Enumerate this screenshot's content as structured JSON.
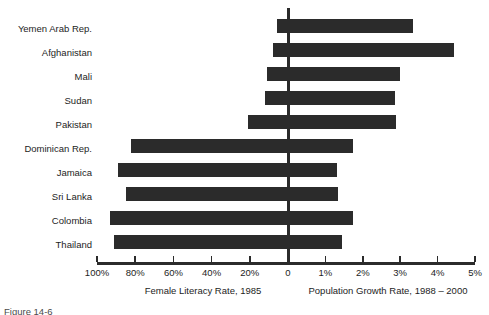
{
  "chart_data": {
    "type": "bar",
    "orientation": "horizontal",
    "subtype": "bidirectional-diverging",
    "title": "",
    "categories": [
      "Yemen Arab Rep.",
      "Afghanistan",
      "Mali",
      "Sudan",
      "Pakistan",
      "Dominican Rep.",
      "Jamaica",
      "Sri Lanka",
      "Colombia",
      "Thailand"
    ],
    "series": [
      {
        "name": "Female Literacy Rate, 1985",
        "axis": "left",
        "unit": "%",
        "direction": "leftward",
        "values": [
          6,
          8,
          11,
          12,
          21,
          82,
          89,
          85,
          93,
          91
        ]
      },
      {
        "name": "Population Growth  Rate, 1988 – 2000",
        "axis": "right",
        "unit": "%",
        "direction": "rightward",
        "values": [
          3.35,
          4.45,
          3.0,
          2.85,
          2.9,
          1.75,
          1.3,
          1.35,
          1.75,
          1.45
        ]
      }
    ],
    "left_axis": {
      "label": "Female Literacy Rate, 1985",
      "ticks": [
        "100%",
        "80%",
        "60%",
        "40%",
        "20%",
        "0"
      ],
      "tick_values": [
        100,
        80,
        60,
        40,
        20,
        0
      ],
      "range": [
        100,
        0
      ],
      "reversed": true
    },
    "right_axis": {
      "label": "Population Growth  Rate, 1988 – 2000",
      "ticks": [
        "0",
        "1%",
        "2%",
        "3%",
        "4%",
        "5%"
      ],
      "tick_values": [
        0,
        1,
        2,
        3,
        4,
        5
      ],
      "range": [
        0,
        5
      ]
    },
    "grid": false,
    "legend": "none",
    "bar_color": "#2b2b2b",
    "background_color": "#ffffff"
  },
  "axis": {
    "tick_labels": [
      "100%",
      "80%",
      "60%",
      "40%",
      "20%",
      "0",
      "1%",
      "2%",
      "3%",
      "4%",
      "5%"
    ],
    "left_title": "Female Literacy Rate, 1985",
    "right_title": "Population Growth  Rate, 1988 – 2000"
  },
  "caption": {
    "text": "Figure 14-6"
  }
}
